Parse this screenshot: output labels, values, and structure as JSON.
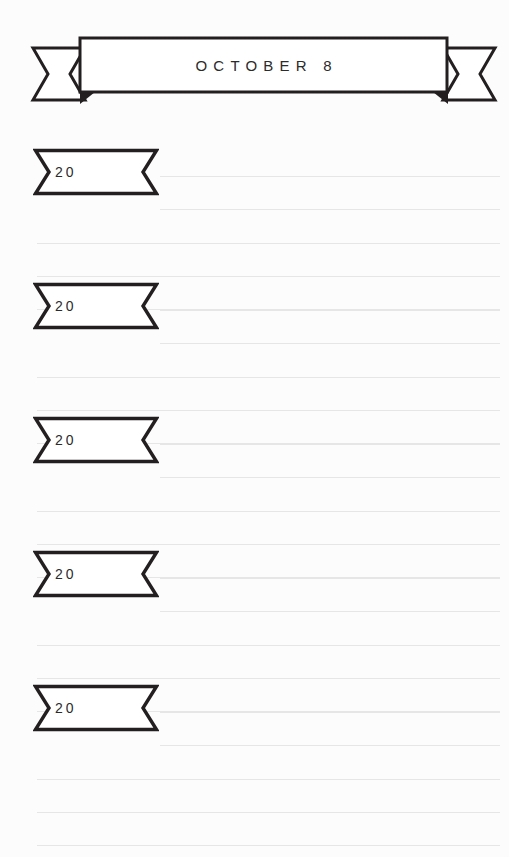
{
  "page": {
    "width": 509,
    "height": 857,
    "background_color": "#fcfcfc",
    "ink_color": "#231f20",
    "rule_color": "#e6e6e6",
    "type": "journal-page"
  },
  "header": {
    "icon": "ribbon-banner-icon",
    "title": "OCTOBER 8"
  },
  "entries": [
    {
      "label": "20",
      "icon": "ribbon-tag-icon",
      "top": 148,
      "short_rules": 2,
      "full_rules": 3
    },
    {
      "label": "20",
      "icon": "ribbon-tag-icon",
      "top": 282,
      "short_rules": 2,
      "full_rules": 3
    },
    {
      "label": "20",
      "icon": "ribbon-tag-icon",
      "top": 416,
      "short_rules": 2,
      "full_rules": 3
    },
    {
      "label": "20",
      "icon": "ribbon-tag-icon",
      "top": 550,
      "short_rules": 2,
      "full_rules": 3
    },
    {
      "label": "20",
      "icon": "ribbon-tag-icon",
      "top": 684,
      "short_rules": 2,
      "full_rules": 3
    }
  ],
  "rules": {
    "short_rule_offsets": [
      28,
      61
    ],
    "full_rule_offsets": [
      95,
      128,
      161
    ]
  }
}
